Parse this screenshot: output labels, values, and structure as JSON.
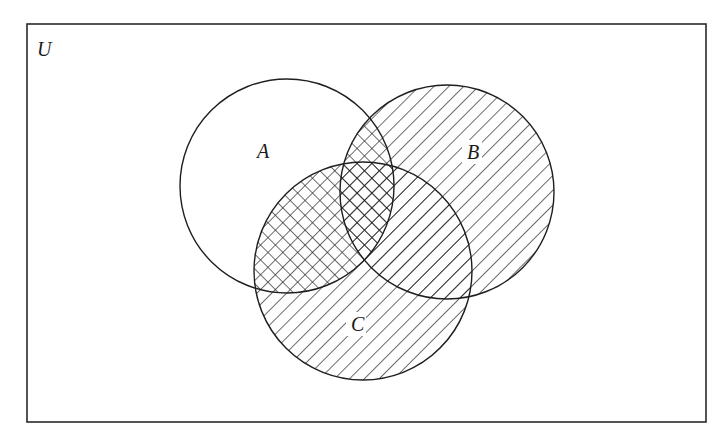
{
  "diagram": {
    "type": "venn",
    "title": "",
    "depicts": "A ∩ (B ∪ C)",
    "universe": {
      "label": "U",
      "rect": {
        "x": 27,
        "y": 24,
        "width": 679,
        "height": 398
      },
      "label_pos": {
        "x": 37,
        "y": 56
      }
    },
    "sets": [
      {
        "id": "A",
        "label": "A",
        "cx": 287,
        "cy": 186,
        "r": 107,
        "label_pos": {
          "x": 257,
          "y": 158
        },
        "pattern": "none (crosshatch where overlapping B or C)"
      },
      {
        "id": "B",
        "label": "B",
        "cx": 447,
        "cy": 192,
        "r": 107,
        "label_pos": {
          "x": 467,
          "y": 159
        },
        "pattern": "diagonal hatch"
      },
      {
        "id": "C",
        "label": "C",
        "cx": 363,
        "cy": 271,
        "r": 109,
        "label_pos": {
          "x": 351,
          "y": 331
        },
        "pattern": "diagonal hatch"
      }
    ],
    "shading": {
      "single_hatch_region": "B ∪ C",
      "cross_hatch_region": "A ∩ (B ∪ C)",
      "unshaded_region": "A − (B ∪ C)",
      "hatch_spacing_px": 10.5,
      "line_color": "#1e1e1e",
      "background_color": "#ffffff"
    }
  }
}
